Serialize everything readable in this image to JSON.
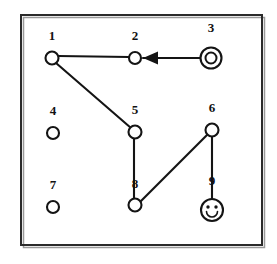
{
  "figure": {
    "name": "graph-diagram",
    "background_color": "#ffffff",
    "ink_color": "#141414",
    "frame": {
      "name": "outer-frame",
      "x": 21,
      "y": 15,
      "width": 241,
      "height": 230,
      "border_color": "#2b2b2b"
    }
  },
  "nodes": [
    {
      "id": "1",
      "label": "1",
      "cx": 52,
      "cy": 58,
      "r": 6.5,
      "shape": "circle",
      "label_dx": 0,
      "label_dy": -12
    },
    {
      "id": "2",
      "label": "2",
      "cx": 135,
      "cy": 58,
      "r": 6.0,
      "shape": "circle",
      "label_dx": 0,
      "label_dy": -12
    },
    {
      "id": "3",
      "label": "3",
      "cx": 211,
      "cy": 58,
      "r": 10.5,
      "shape": "double-circle",
      "inner_r": 5.5,
      "label_dx": 0,
      "label_dy": -16
    },
    {
      "id": "4",
      "label": "4",
      "cx": 53,
      "cy": 133,
      "r": 6.0,
      "shape": "circle",
      "label_dx": 0,
      "label_dy": -12
    },
    {
      "id": "5",
      "label": "5",
      "cx": 135,
      "cy": 132,
      "r": 6.5,
      "shape": "circle",
      "label_dx": 0,
      "label_dy": -12
    },
    {
      "id": "6",
      "label": "6",
      "cx": 212,
      "cy": 130,
      "r": 6.5,
      "shape": "circle",
      "label_dx": 0,
      "label_dy": -12
    },
    {
      "id": "7",
      "label": "7",
      "cx": 53,
      "cy": 207,
      "r": 6.0,
      "shape": "circle",
      "label_dx": 0,
      "label_dy": -12
    },
    {
      "id": "8",
      "label": "8",
      "cx": 135,
      "cy": 205,
      "r": 6.5,
      "shape": "circle",
      "label_dx": 0,
      "label_dy": -11
    },
    {
      "id": "9",
      "label": "9",
      "cx": 212,
      "cy": 210,
      "r": 11.0,
      "shape": "smiley",
      "label_dx": 0,
      "label_dy": -14
    }
  ],
  "edges": [
    {
      "id": "e-1-2",
      "from": "1",
      "to": "2",
      "directed": false,
      "x1": 58,
      "y1": 56,
      "x2": 129,
      "y2": 57
    },
    {
      "id": "e-3-2",
      "from": "3",
      "to": "2",
      "directed": true,
      "x1": 200,
      "y1": 58,
      "x2": 143,
      "y2": 58
    },
    {
      "id": "e-1-5",
      "from": "1",
      "to": "5",
      "directed": false,
      "x1": 56,
      "y1": 63,
      "x2": 131,
      "y2": 128
    },
    {
      "id": "e-5-8",
      "from": "5",
      "to": "8",
      "directed": false,
      "x1": 134,
      "y1": 138,
      "x2": 134,
      "y2": 199
    },
    {
      "id": "e-8-6",
      "from": "8",
      "to": "6",
      "directed": false,
      "x1": 140,
      "y1": 202,
      "x2": 207,
      "y2": 135
    },
    {
      "id": "e-6-9",
      "from": "6",
      "to": "9",
      "directed": false,
      "x1": 212,
      "y1": 137,
      "x2": 212,
      "y2": 199
    }
  ],
  "arrowhead": {
    "name": "arrowhead-left",
    "tip_x": 143,
    "tip_y": 58,
    "back_x": 158,
    "half_height": 6.5
  },
  "smiley": {
    "name": "smiley-face",
    "left_eye_dx": -4.0,
    "right_eye_dx": 4.0,
    "eye_dy": -3.0,
    "eye_r": 1.7,
    "smile_dy": 1.5,
    "smile_r": 5.5
  },
  "isolated_nodes": [
    "4",
    "7"
  ],
  "accepting_nodes": [
    "3"
  ],
  "face_nodes": [
    "9"
  ]
}
